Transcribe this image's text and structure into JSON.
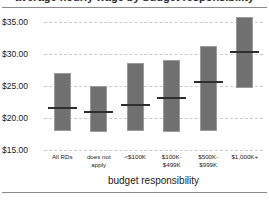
{
  "chart_data": {
    "type": "bar",
    "title": "average hourly wage by budget responsibility",
    "xlabel": "budget responsibility",
    "ylabel": "",
    "categories": [
      "All RDs",
      "does not apply",
      "<$100K",
      "$100K-$499K",
      "$500K-$999K",
      "$1,000K+"
    ],
    "category_lines": [
      [
        "All RDs"
      ],
      [
        "does not",
        "apply"
      ],
      [
        "<$100K"
      ],
      [
        "$100K-",
        "$499K"
      ],
      [
        "$500K-",
        "$999K"
      ],
      [
        "$1,000K+"
      ]
    ],
    "series": [
      {
        "name": "range (low to high)",
        "low": [
          18.0,
          17.8,
          18.0,
          17.8,
          17.9,
          24.7
        ],
        "high": [
          27.0,
          25.0,
          28.6,
          29.1,
          31.3,
          35.8
        ]
      },
      {
        "name": "median",
        "values": [
          21.6,
          20.9,
          22.0,
          23.1,
          25.6,
          30.3
        ]
      }
    ],
    "ylim": [
      15.0,
      35.0
    ],
    "yticks": [
      15.0,
      20.0,
      25.0,
      30.0,
      35.0
    ],
    "ytick_labels": [
      "$15.00",
      "$20.00",
      "$25.00",
      "$30.00",
      "$35.00"
    ],
    "grid": true,
    "legend": "none",
    "bar_color": "#707070",
    "bar_border_color": "#9b9b9b",
    "median_color": "#2e2e2e",
    "grid_color": "#c9c9c9"
  }
}
